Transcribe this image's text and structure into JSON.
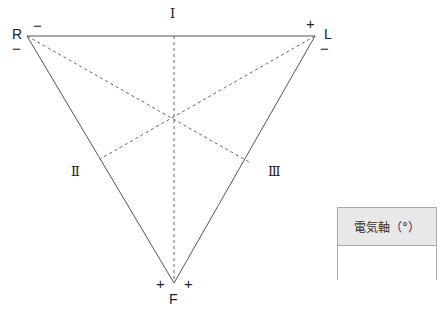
{
  "diagram": {
    "vertices": {
      "R": {
        "label": "R",
        "signs": [
          "−",
          "−"
        ]
      },
      "L": {
        "label": "L",
        "signs": [
          "+",
          "−"
        ]
      },
      "F": {
        "label": "F",
        "signs": [
          "+",
          "+"
        ]
      }
    },
    "leads": {
      "I": "Ⅰ",
      "II": "Ⅱ",
      "III": "Ⅲ"
    }
  },
  "axis_box": {
    "header": "電気軸（°）",
    "value": ""
  }
}
